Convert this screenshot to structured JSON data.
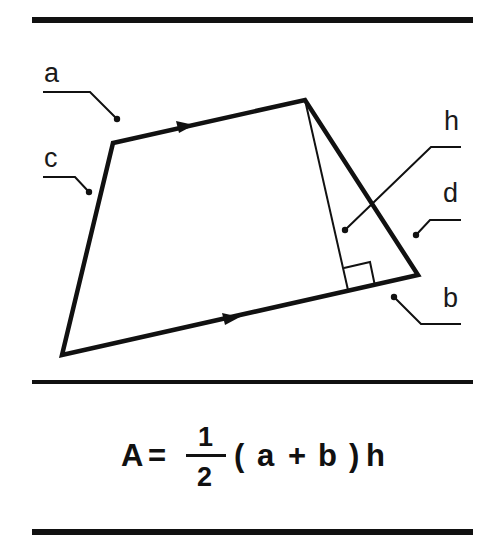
{
  "diagram": {
    "colors": {
      "stroke": "#111111",
      "background": "#ffffff"
    },
    "labels": {
      "a": "a",
      "b": "b",
      "c": "c",
      "d": "d",
      "h": "h"
    },
    "formula": {
      "lhs": "A",
      "equals": "=",
      "numerator": "1",
      "denominator": "2",
      "open_paren": "(",
      "a": "a",
      "plus": "+",
      "b": "b",
      "close_paren": ")",
      "h": "h",
      "text": "A = 1/2 (a + b) h"
    },
    "shape": {
      "vertices": {
        "top_left": [
          113,
          143
        ],
        "top_right": [
          305,
          100
        ],
        "bottom_right": [
          418,
          275
        ],
        "bottom_left": [
          62,
          355
        ]
      },
      "height_foot": [
        348,
        290
      ]
    }
  }
}
